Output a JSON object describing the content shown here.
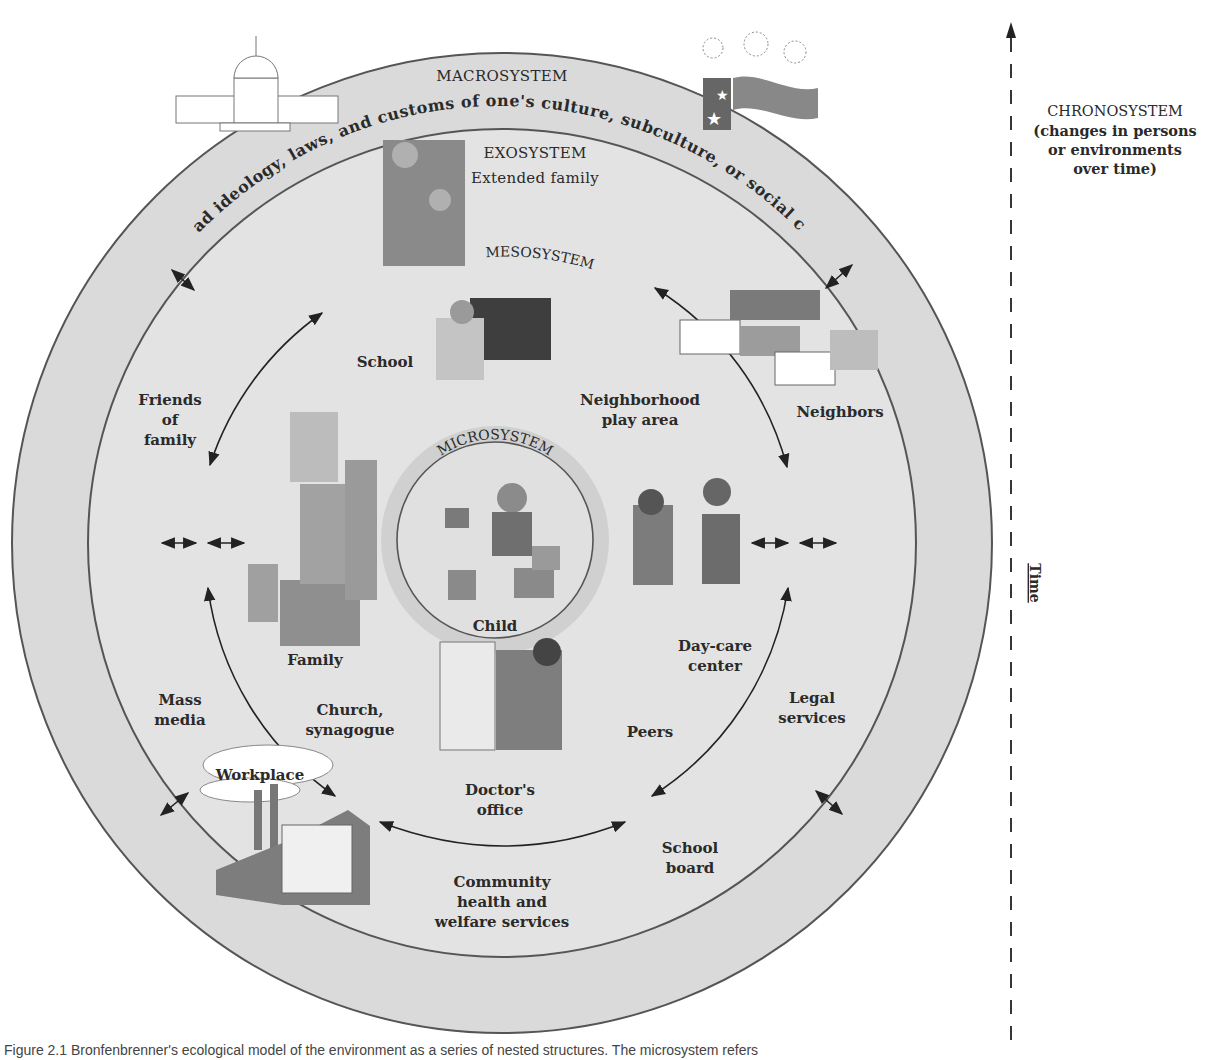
{
  "diagram": {
    "colors": {
      "ring_fill": "#d9d9d9",
      "inner_fill": "#e6e6e6",
      "micro_ring": "#cfcfcf",
      "stroke": "#555555",
      "text": "#2a2a2a",
      "background": "#ffffff"
    },
    "macrosystem": {
      "label": "MACROSYSTEM",
      "description": "Broad ideology, laws, and customs of one's culture, subculture, or social class",
      "icons": [
        "capitol-building-icon",
        "flag-fireworks-icon"
      ]
    },
    "exosystem": {
      "label": "EXOSYSTEM",
      "items": [
        {
          "id": "extended-family",
          "label": "Extended family"
        },
        {
          "id": "friends-of-family",
          "label": "Friends\nof\nfamily"
        },
        {
          "id": "neighbors",
          "label": "Neighbors"
        },
        {
          "id": "mass-media",
          "label": "Mass\nmedia"
        },
        {
          "id": "legal-services",
          "label": "Legal\nservices"
        },
        {
          "id": "workplace",
          "label": "Workplace"
        },
        {
          "id": "school-board",
          "label": "School\nboard"
        },
        {
          "id": "community-health",
          "label": "Community\nhealth and\nwelfare services"
        }
      ]
    },
    "mesosystem": {
      "label": "MESOSYSTEM"
    },
    "microsystem": {
      "label": "MICROSYSTEM",
      "center": "Child",
      "items": [
        {
          "id": "school",
          "label": "School"
        },
        {
          "id": "neighborhood-play-area",
          "label": "Neighborhood\nplay area"
        },
        {
          "id": "family",
          "label": "Family"
        },
        {
          "id": "day-care-center",
          "label": "Day-care\ncenter"
        },
        {
          "id": "church-synagogue",
          "label": "Church,\nsynagogue"
        },
        {
          "id": "peers",
          "label": "Peers"
        },
        {
          "id": "doctors-office",
          "label": "Doctor's\noffice"
        }
      ]
    },
    "chronosystem": {
      "label": "CHRONOSYSTEM",
      "description": "(changes in persons\nor environments\nover time)",
      "axis_label": "Time"
    },
    "caption": "Figure 2.1  Bronfenbrenner's ecological model of the environment as a series of nested structures. The microsystem refers"
  }
}
